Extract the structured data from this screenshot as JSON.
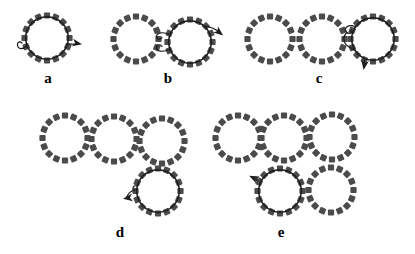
{
  "figure": {
    "width": 415,
    "height": 254,
    "background": "#ffffff",
    "colors": {
      "bead": "#4b4b4b",
      "strand": "#1c1c1c",
      "label": "#000000"
    },
    "ring": {
      "bead_count": 16,
      "bead_width": 6.2,
      "bead_height": 6.2,
      "bead_corner_radius": 1,
      "bead_ring_radius": 22.5,
      "wrap_radius": 21.3,
      "wrap_stroke_width": 1.5,
      "decoration_stroke_width": 1.2
    },
    "panels": [
      {
        "id": "a",
        "label": "a",
        "label_x": 48,
        "label_y": 83,
        "circles": [
          {
            "cx": 47,
            "cy": 38,
            "wrapped": true
          }
        ],
        "strokes": [
          {
            "name": "start-tail",
            "d": "M 27 45.5 C 23 50 18 49.5 17.5 45 C 17.2 42 20 41 22 43"
          },
          {
            "name": "exit-line",
            "d": "M 67.5 43.5 C 72 44.5 76 44.5 79 44"
          }
        ],
        "arrowhead": {
          "x": 80.5,
          "y": 44,
          "angle": 10
        }
      },
      {
        "id": "b",
        "label": "b",
        "label_x": 168,
        "label_y": 83,
        "circles": [
          {
            "cx": 136,
            "cy": 39,
            "wrapped": false
          },
          {
            "cx": 190,
            "cy": 42,
            "wrapped": true
          }
        ],
        "strokes": [
          {
            "name": "junction-top-hook",
            "d": "M 170 34.5 C 163 31.5 156.5 32.5 156.5 36.5 C 156.5 39.5 160.5 40 162 37.5"
          },
          {
            "name": "junction-bottom-hook",
            "d": "M 170 49.5 C 163 52.5 156.5 51.5 156.5 47.5 C 156.5 44.5 160.5 44 162 46.5"
          },
          {
            "name": "exit-line",
            "d": "M 204 26.5 C 210 26 216 29.5 220.5 33"
          }
        ],
        "arrowhead": {
          "x": 222,
          "y": 34.5,
          "angle": 38
        }
      },
      {
        "id": "c",
        "label": "c",
        "label_x": 319,
        "label_y": 83,
        "circles": [
          {
            "cx": 270,
            "cy": 39,
            "wrapped": false
          },
          {
            "cx": 322,
            "cy": 39,
            "wrapped": false
          },
          {
            "cx": 373,
            "cy": 39,
            "wrapped": true
          }
        ],
        "strokes": [
          {
            "name": "junction-loop",
            "d": "M 356 27 C 348 23.5 342.5 28.5 347 32.5 C 349.5 34.5 352.5 33 351 30.2 M 347 32.5 C 342.5 36.5 342.5 43 349 47 C 351 48.3 353.5 49.5 355.5 50.5"
          },
          {
            "name": "exit-line",
            "d": "M 365 59 C 364 62 363.8 64.5 364 66.5"
          }
        ],
        "arrowhead": {
          "x": 363.8,
          "y": 68.5,
          "angle": 99
        }
      },
      {
        "id": "d",
        "label": "d",
        "label_x": 120,
        "label_y": 237,
        "circles": [
          {
            "cx": 65,
            "cy": 138,
            "wrapped": false
          },
          {
            "cx": 114,
            "cy": 139,
            "wrapped": false
          },
          {
            "cx": 162,
            "cy": 141,
            "wrapped": false
          },
          {
            "cx": 158,
            "cy": 191,
            "wrapped": true
          }
        ],
        "strokes": [
          {
            "name": "exit-line",
            "d": "M 137.5 186 C 133.5 185 131.5 188 134.5 190 C 131 191 128 194 126.8 196.8"
          }
        ],
        "arrowhead": {
          "x": 124.5,
          "y": 198.5,
          "angle": 172
        }
      },
      {
        "id": "e",
        "label": "e",
        "label_x": 281,
        "label_y": 237,
        "circles": [
          {
            "cx": 238,
            "cy": 138,
            "wrapped": false
          },
          {
            "cx": 284,
            "cy": 138,
            "wrapped": false
          },
          {
            "cx": 332,
            "cy": 137,
            "wrapped": false
          },
          {
            "cx": 280,
            "cy": 191,
            "wrapped": true
          },
          {
            "cx": 331,
            "cy": 190,
            "wrapped": false
          }
        ],
        "strokes": [
          {
            "name": "exit-line",
            "d": "M 261.5 180 C 258.5 176.5 255.5 177.5 257 180.5 C 255 179.5 253.5 178.5 252.5 178"
          }
        ],
        "arrowhead": {
          "x": 250.5,
          "y": 176.5,
          "angle": 205
        }
      }
    ]
  }
}
